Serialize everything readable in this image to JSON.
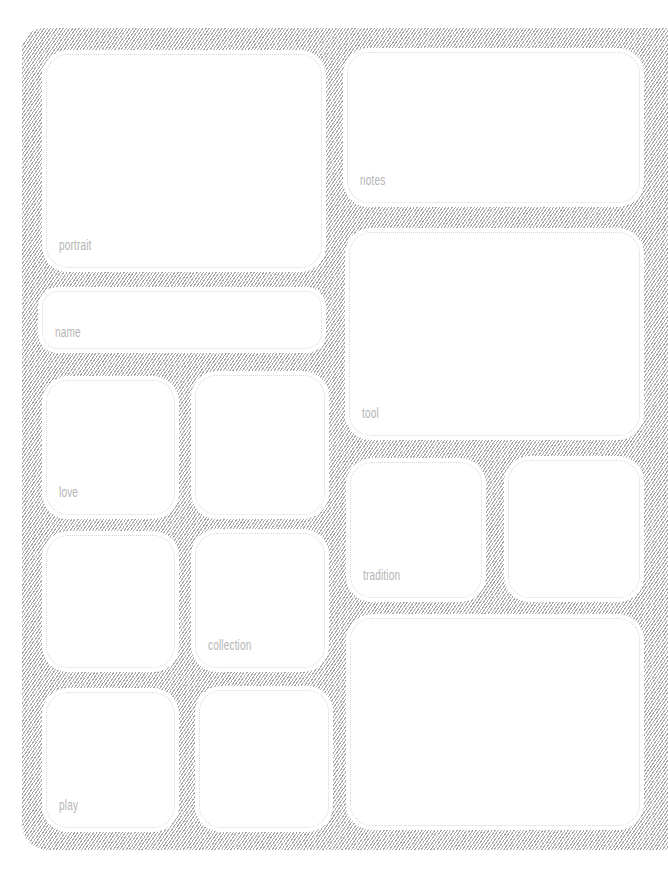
{
  "page": {
    "title": "",
    "colors": {
      "hatch": "#a9a9a9",
      "box_fill": "#ffffff",
      "box_border": "#d6d6d6",
      "label": "#b4b4b4"
    }
  },
  "boxes": [
    {
      "id": "portrait",
      "label": "portrait",
      "x": 46,
      "y": 54,
      "w": 276,
      "h": 214
    },
    {
      "id": "notes",
      "label": "notes",
      "x": 347,
      "y": 52,
      "w": 293,
      "h": 151
    },
    {
      "id": "name",
      "label": "name",
      "x": 42,
      "y": 291,
      "w": 280,
      "h": 58
    },
    {
      "id": "tool",
      "label": "tool",
      "x": 349,
      "y": 232,
      "w": 291,
      "h": 204
    },
    {
      "id": "love",
      "label": "love",
      "x": 46,
      "y": 380,
      "w": 129,
      "h": 135
    },
    {
      "id": "blank-1",
      "label": "",
      "x": 195,
      "y": 375,
      "w": 130,
      "h": 140
    },
    {
      "id": "tradition",
      "label": "tradition",
      "x": 350,
      "y": 462,
      "w": 132,
      "h": 136
    },
    {
      "id": "blank-2",
      "label": "",
      "x": 508,
      "y": 460,
      "w": 132,
      "h": 138
    },
    {
      "id": "blank-3",
      "label": "",
      "x": 46,
      "y": 535,
      "w": 129,
      "h": 133
    },
    {
      "id": "collection",
      "label": "collection",
      "x": 195,
      "y": 533,
      "w": 130,
      "h": 135
    },
    {
      "id": "blank-4",
      "label": "",
      "x": 350,
      "y": 618,
      "w": 290,
      "h": 208
    },
    {
      "id": "play",
      "label": "play",
      "x": 46,
      "y": 692,
      "w": 129,
      "h": 136
    },
    {
      "id": "blank-5",
      "label": "",
      "x": 199,
      "y": 690,
      "w": 130,
      "h": 138
    }
  ]
}
